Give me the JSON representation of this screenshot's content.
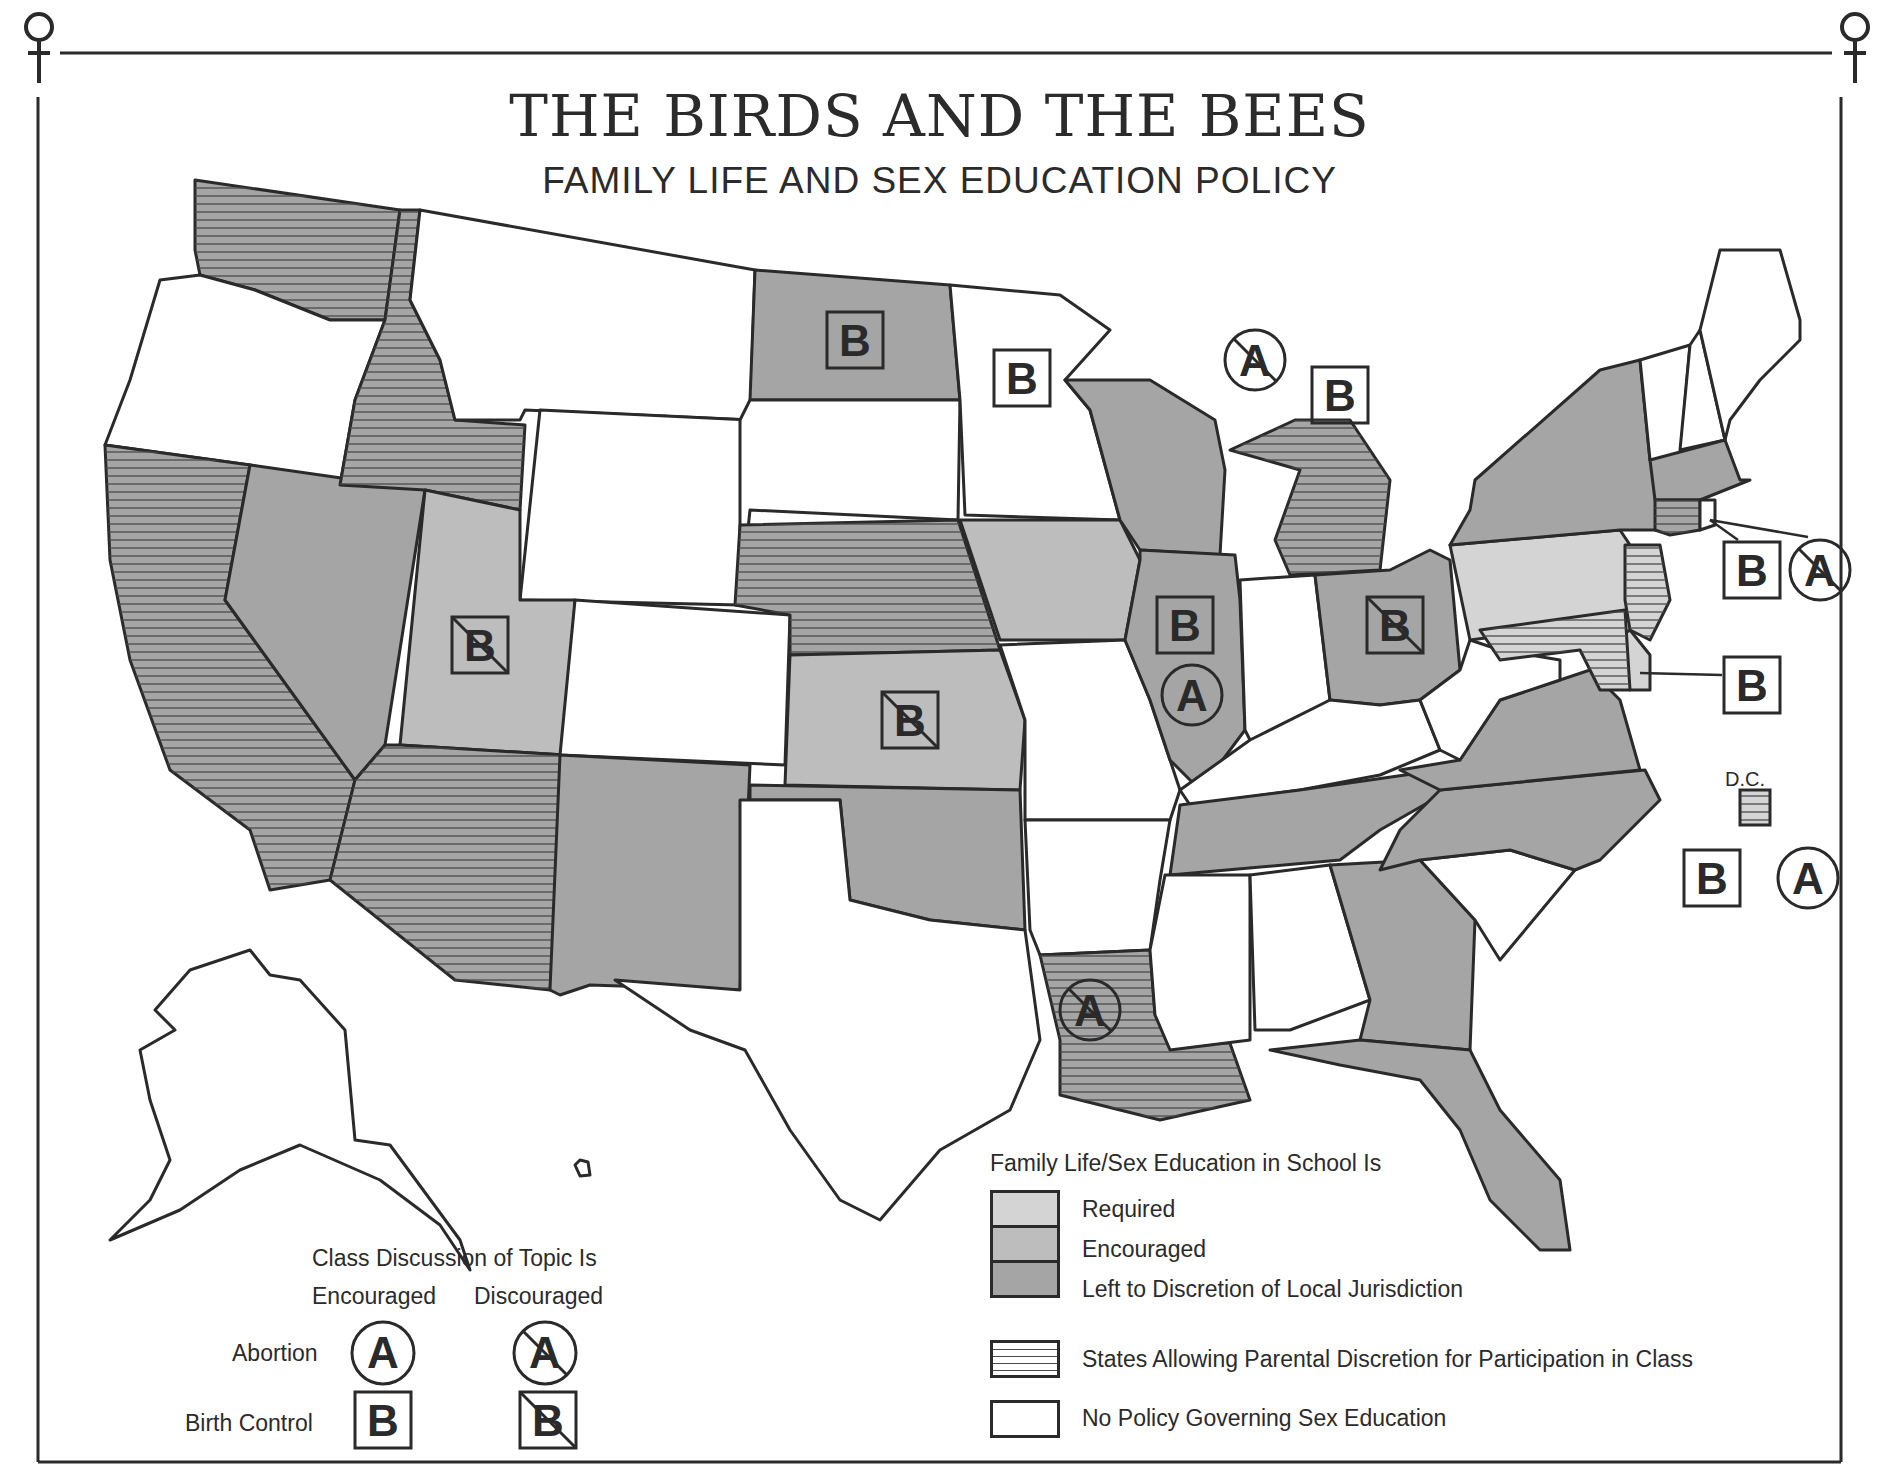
{
  "header": {
    "title": "THE BIRDS AND THE BEES",
    "subtitle": "FAMILY LIFE AND SEX EDUCATION POLICY"
  },
  "colors": {
    "required": "#d4d4d4",
    "encouraged": "#bdbdbd",
    "local": "#a5a5a5",
    "none": "#ffffff",
    "outline": "#2a2a2a",
    "hatch": "#4a4a4a"
  },
  "legend_policy": {
    "heading": "Family Life/Sex Education in School Is",
    "items": [
      {
        "key": "required",
        "label": "Required"
      },
      {
        "key": "encouraged",
        "label": "Encouraged"
      },
      {
        "key": "local",
        "label": "Left to Discretion of Local Jurisdiction"
      },
      {
        "key": "parental",
        "label": "States Allowing Parental Discretion for Participation in Class"
      },
      {
        "key": "none",
        "label": "No Policy Governing Sex Education"
      }
    ]
  },
  "legend_discussion": {
    "heading": "Class Discussion of Topic Is",
    "col_encouraged": "Encouraged",
    "col_discouraged": "Discouraged",
    "row_abortion": "Abortion",
    "row_birth_control": "Birth Control",
    "abortion_symbol": "A",
    "birth_control_symbol": "B"
  },
  "dc": {
    "label": "D.C.",
    "policy": "required",
    "parental": true,
    "birth_control": "encouraged",
    "abortion": "encouraged"
  },
  "states": [
    {
      "id": "WA",
      "policy": "local",
      "parental": true
    },
    {
      "id": "OR",
      "policy": "none",
      "parental": false
    },
    {
      "id": "CA",
      "policy": "local",
      "parental": true
    },
    {
      "id": "NV",
      "policy": "local",
      "parental": false
    },
    {
      "id": "ID",
      "policy": "local",
      "parental": true
    },
    {
      "id": "MT",
      "policy": "none",
      "parental": false
    },
    {
      "id": "WY",
      "policy": "none",
      "parental": false
    },
    {
      "id": "UT",
      "policy": "encouraged",
      "parental": false,
      "birth_control": "discouraged"
    },
    {
      "id": "AZ",
      "policy": "local",
      "parental": true
    },
    {
      "id": "CO",
      "policy": "none",
      "parental": false
    },
    {
      "id": "NM",
      "policy": "local",
      "parental": false
    },
    {
      "id": "ND",
      "policy": "local",
      "parental": false,
      "birth_control": "encouraged"
    },
    {
      "id": "SD",
      "policy": "none",
      "parental": false
    },
    {
      "id": "NE",
      "policy": "local",
      "parental": true
    },
    {
      "id": "KS",
      "policy": "encouraged",
      "parental": false,
      "birth_control": "discouraged"
    },
    {
      "id": "OK",
      "policy": "local",
      "parental": false
    },
    {
      "id": "TX",
      "policy": "none",
      "parental": false
    },
    {
      "id": "MN",
      "policy": "none",
      "parental": false,
      "birth_control": "encouraged"
    },
    {
      "id": "IA",
      "policy": "encouraged",
      "parental": false
    },
    {
      "id": "MO",
      "policy": "none",
      "parental": false
    },
    {
      "id": "AR",
      "policy": "none",
      "parental": false
    },
    {
      "id": "LA",
      "policy": "local",
      "parental": true,
      "abortion": "discouraged"
    },
    {
      "id": "WI",
      "policy": "local",
      "parental": false
    },
    {
      "id": "IL",
      "policy": "local",
      "parental": false,
      "birth_control": "encouraged",
      "abortion": "encouraged"
    },
    {
      "id": "MI",
      "policy": "local",
      "parental": true,
      "birth_control": "encouraged",
      "abortion": "discouraged"
    },
    {
      "id": "IN",
      "policy": "none",
      "parental": false
    },
    {
      "id": "OH",
      "policy": "local",
      "parental": false,
      "birth_control": "discouraged"
    },
    {
      "id": "KY",
      "policy": "none",
      "parental": false
    },
    {
      "id": "TN",
      "policy": "local",
      "parental": false
    },
    {
      "id": "MS",
      "policy": "none",
      "parental": false
    },
    {
      "id": "AL",
      "policy": "none",
      "parental": false
    },
    {
      "id": "GA",
      "policy": "local",
      "parental": false
    },
    {
      "id": "FL",
      "policy": "local",
      "parental": false
    },
    {
      "id": "SC",
      "policy": "none",
      "parental": false
    },
    {
      "id": "NC",
      "policy": "local",
      "parental": false
    },
    {
      "id": "VA",
      "policy": "local",
      "parental": false
    },
    {
      "id": "WV",
      "policy": "none",
      "parental": false
    },
    {
      "id": "PA",
      "policy": "required",
      "parental": false
    },
    {
      "id": "NY",
      "policy": "local",
      "parental": false
    },
    {
      "id": "NJ",
      "policy": "required",
      "parental": true,
      "birth_control": "encouraged",
      "abortion": "discouraged"
    },
    {
      "id": "DE",
      "policy": "required",
      "parental": false,
      "birth_control": "encouraged"
    },
    {
      "id": "MD",
      "policy": "required",
      "parental": true
    },
    {
      "id": "VT",
      "policy": "none",
      "parental": false
    },
    {
      "id": "NH",
      "policy": "none",
      "parental": false
    },
    {
      "id": "ME",
      "policy": "none",
      "parental": false
    },
    {
      "id": "MA",
      "policy": "local",
      "parental": false
    },
    {
      "id": "CT",
      "policy": "local",
      "parental": true
    },
    {
      "id": "RI",
      "policy": "none",
      "parental": false
    },
    {
      "id": "AK",
      "policy": "none",
      "parental": false
    },
    {
      "id": "HI",
      "policy": "none",
      "parental": false
    }
  ]
}
